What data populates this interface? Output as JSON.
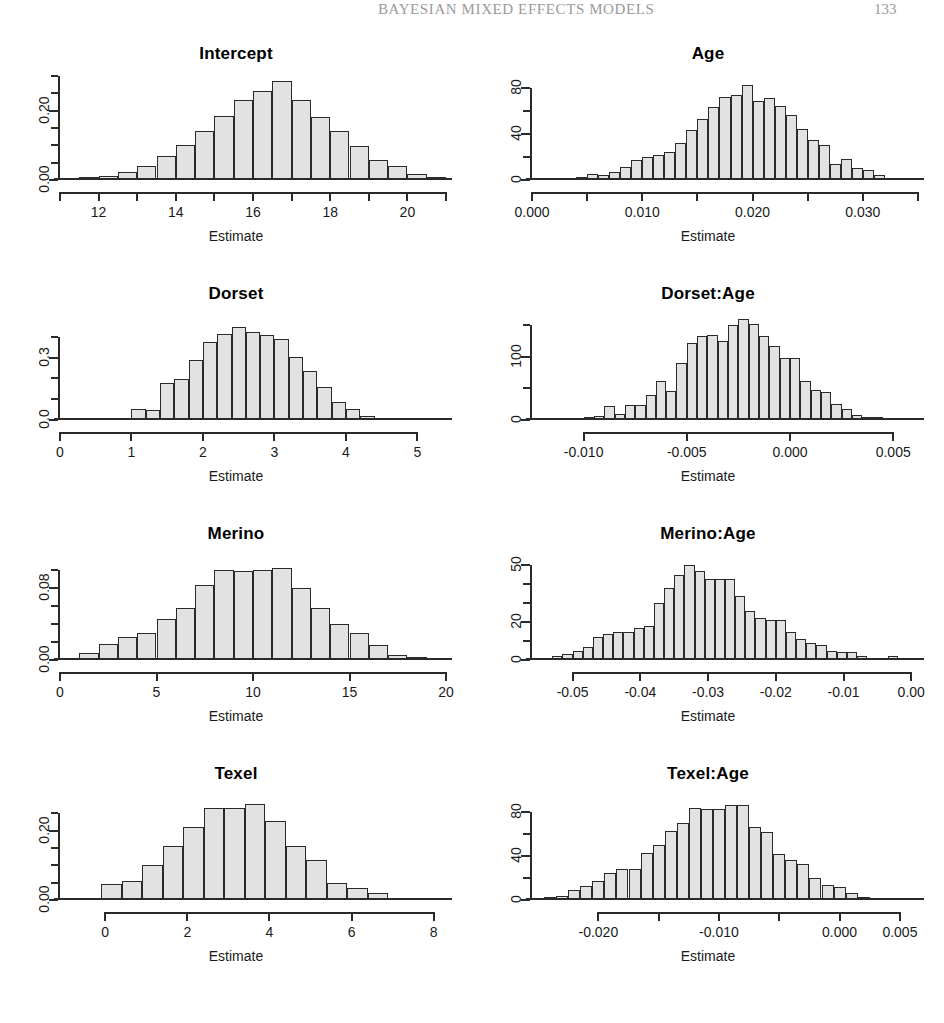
{
  "running_head": {
    "title": "BAYESIAN MIXED EFFECTS MODELS",
    "page_number": "133"
  },
  "figure": {
    "shared_xlabel": "Estimate",
    "panels": [
      {
        "title": "Intercept",
        "xlabel": "Estimate",
        "chart_data": {
          "type": "bar",
          "title": "Intercept",
          "xlabel": "Estimate",
          "ylabel": "Density",
          "xlim": [
            11.0,
            21.0
          ],
          "ylim": [
            0.0,
            0.3
          ],
          "bin_width": 0.5,
          "x_ticks": [
            12,
            14,
            16,
            18,
            20
          ],
          "x_tick_labels": [
            "12",
            "14",
            "16",
            "18",
            "20"
          ],
          "x_minor_ticks": [
            11,
            13,
            15,
            17,
            19,
            21
          ],
          "y_ticks": [
            0.0,
            0.05,
            0.1,
            0.15,
            0.2,
            0.25,
            0.3
          ],
          "y_tick_labels": [
            "0.00",
            "",
            "",
            "",
            "0.20",
            "",
            ""
          ],
          "y_labeled_ticks": [
            0.0,
            0.2
          ],
          "grid": false,
          "bin_starts": [
            11.0,
            11.5,
            12.0,
            12.5,
            13.0,
            13.5,
            14.0,
            14.5,
            15.0,
            15.5,
            16.0,
            16.5,
            17.0,
            17.5,
            18.0,
            18.5,
            19.0,
            19.5,
            20.0,
            20.5
          ],
          "values": [
            0.004,
            0.008,
            0.012,
            0.022,
            0.04,
            0.068,
            0.1,
            0.14,
            0.185,
            0.232,
            0.258,
            0.286,
            0.232,
            0.182,
            0.14,
            0.098,
            0.058,
            0.04,
            0.018,
            0.008
          ]
        }
      },
      {
        "title": "Age",
        "xlabel": "Estimate",
        "chart_data": {
          "type": "bar",
          "title": "Age",
          "xlabel": "Estimate",
          "ylabel": "Frequency",
          "xlim": [
            0.0,
            0.035
          ],
          "ylim": [
            0,
            90
          ],
          "bin_width": 0.001,
          "x_ticks": [
            0.0,
            0.01,
            0.02,
            0.03
          ],
          "x_tick_labels": [
            "0.000",
            "0.010",
            "0.020",
            "0.030"
          ],
          "x_minor_ticks": [
            0.005,
            0.015,
            0.025,
            0.035
          ],
          "y_ticks": [
            0,
            20,
            40,
            60,
            80
          ],
          "y_tick_labels": [
            "0",
            "",
            "40",
            "",
            "80"
          ],
          "y_labeled_ticks": [
            0,
            40,
            80
          ],
          "grid": false,
          "bin_starts": [
            0.0,
            0.001,
            0.002,
            0.003,
            0.004,
            0.005,
            0.006,
            0.007,
            0.008,
            0.009,
            0.01,
            0.011,
            0.012,
            0.013,
            0.014,
            0.015,
            0.016,
            0.017,
            0.018,
            0.019,
            0.02,
            0.021,
            0.022,
            0.023,
            0.024,
            0.025,
            0.026,
            0.027,
            0.028,
            0.029,
            0.03,
            0.031,
            0.032,
            0.033,
            0.034
          ],
          "values": [
            0,
            0,
            0,
            1,
            3,
            5,
            4,
            7,
            11,
            17,
            20,
            22,
            24,
            32,
            43,
            53,
            63,
            72,
            74,
            82,
            68,
            71,
            64,
            56,
            44,
            35,
            30,
            14,
            18,
            10,
            9,
            4,
            2,
            2,
            1
          ]
        }
      },
      {
        "title": "Dorset",
        "xlabel": "Estimate",
        "chart_data": {
          "type": "bar",
          "title": "Dorset",
          "xlabel": "Estimate",
          "ylabel": "Density",
          "xlim": [
            0.0,
            5.4
          ],
          "ylim": [
            0.0,
            0.5
          ],
          "bin_width": 0.2,
          "x_ticks": [
            0,
            1,
            2,
            3,
            4,
            5
          ],
          "x_tick_labels": [
            "0",
            "1",
            "2",
            "3",
            "4",
            "5"
          ],
          "x_minor_ticks": [],
          "y_ticks": [
            0.0,
            0.1,
            0.2,
            0.3,
            0.4
          ],
          "y_tick_labels": [
            "0.0",
            "",
            "",
            "0.3",
            ""
          ],
          "y_labeled_ticks": [
            0.0,
            0.3
          ],
          "grid": false,
          "bin_starts": [
            0.2,
            0.4,
            0.6,
            0.8,
            1.0,
            1.2,
            1.4,
            1.6,
            1.8,
            2.0,
            2.2,
            2.4,
            2.6,
            2.8,
            3.0,
            3.2,
            3.4,
            3.6,
            3.8,
            4.0,
            4.2,
            4.4,
            4.6,
            4.8,
            5.0
          ],
          "values": [
            0.005,
            0.007,
            0.008,
            0.01,
            0.055,
            0.05,
            0.18,
            0.195,
            0.29,
            0.375,
            0.415,
            0.445,
            0.425,
            0.41,
            0.39,
            0.305,
            0.235,
            0.16,
            0.085,
            0.055,
            0.018,
            0.008,
            0.005,
            0.004,
            0.004
          ]
        }
      },
      {
        "title": "Dorset:Age",
        "xlabel": "Estimate",
        "chart_data": {
          "type": "bar",
          "title": "Dorset:Age",
          "xlabel": "Estimate",
          "ylabel": "Frequency",
          "xlim": [
            -0.0125,
            0.0062
          ],
          "ylim": [
            0,
            165
          ],
          "bin_width": 0.0005,
          "x_ticks": [
            -0.01,
            -0.005,
            0.0,
            0.005
          ],
          "x_tick_labels": [
            "-0.010",
            "-0.005",
            "0.000",
            "0.005"
          ],
          "x_minor_ticks": [],
          "y_ticks": [
            0,
            50,
            100,
            150
          ],
          "y_tick_labels": [
            "0",
            "",
            "100",
            ""
          ],
          "y_labeled_ticks": [
            0,
            100
          ],
          "grid": false,
          "bin_starts": [
            -0.0125,
            -0.012,
            -0.0115,
            -0.011,
            -0.0105,
            -0.01,
            -0.0095,
            -0.009,
            -0.0085,
            -0.008,
            -0.0075,
            -0.007,
            -0.0065,
            -0.006,
            -0.0055,
            -0.005,
            -0.0045,
            -0.004,
            -0.0035,
            -0.003,
            -0.0025,
            -0.002,
            -0.0015,
            -0.001,
            -0.0005,
            0.0,
            0.0005,
            0.001,
            0.0015,
            0.002,
            0.0025,
            0.003,
            0.0035,
            0.004,
            0.0045,
            0.005,
            0.0055
          ],
          "values": [
            2,
            2,
            2,
            3,
            3,
            4,
            6,
            22,
            10,
            24,
            24,
            40,
            62,
            46,
            90,
            122,
            133,
            135,
            126,
            150,
            160,
            152,
            133,
            118,
            98,
            98,
            62,
            48,
            44,
            26,
            18,
            8,
            5,
            4,
            3,
            2,
            2
          ]
        }
      },
      {
        "title": "Merino",
        "xlabel": "Estimate",
        "chart_data": {
          "type": "bar",
          "title": "Merino",
          "xlabel": "Estimate",
          "ylabel": "Density",
          "xlim": [
            0.0,
            20.0
          ],
          "ylim": [
            0.0,
            0.115
          ],
          "bin_width": 1.0,
          "x_ticks": [
            0,
            5,
            10,
            15,
            20
          ],
          "x_tick_labels": [
            "0",
            "5",
            "10",
            "15",
            "20"
          ],
          "x_minor_ticks": [],
          "y_ticks": [
            0.0,
            0.02,
            0.04,
            0.06,
            0.08,
            0.1
          ],
          "y_tick_labels": [
            "0.00",
            "",
            "",
            "",
            "0.08",
            ""
          ],
          "y_labeled_ticks": [
            0.0,
            0.08
          ],
          "grid": false,
          "bin_starts": [
            1,
            2,
            3,
            4,
            5,
            6,
            7,
            8,
            9,
            10,
            11,
            12,
            13,
            14,
            15,
            16,
            17,
            18
          ],
          "values": [
            0.008,
            0.018,
            0.025,
            0.03,
            0.045,
            0.058,
            0.083,
            0.1,
            0.098,
            0.1,
            0.102,
            0.08,
            0.057,
            0.04,
            0.03,
            0.017,
            0.006,
            0.003
          ]
        }
      },
      {
        "title": "Merino:Age",
        "xlabel": "Estimate",
        "chart_data": {
          "type": "bar",
          "title": "Merino:Age",
          "xlabel": "Estimate",
          "ylabel": "Frequency",
          "xlim": [
            -0.056,
            0.001
          ],
          "ylim": [
            0,
            55
          ],
          "bin_width": 0.0015,
          "x_ticks": [
            -0.05,
            -0.04,
            -0.03,
            -0.02,
            -0.01,
            0.0
          ],
          "x_tick_labels": [
            "-0.05",
            "-0.04",
            "-0.03",
            "-0.02",
            "-0.01",
            "0.00"
          ],
          "x_minor_ticks": [],
          "y_ticks": [
            0,
            10,
            20,
            30,
            40,
            50
          ],
          "y_tick_labels": [
            "0",
            "",
            "20",
            "",
            "",
            "50"
          ],
          "y_labeled_ticks": [
            0,
            20,
            50
          ],
          "grid": false,
          "bin_starts": [
            -0.056,
            -0.0545,
            -0.053,
            -0.0515,
            -0.05,
            -0.0485,
            -0.047,
            -0.0455,
            -0.044,
            -0.0425,
            -0.041,
            -0.0395,
            -0.038,
            -0.0365,
            -0.035,
            -0.0335,
            -0.032,
            -0.0305,
            -0.029,
            -0.0275,
            -0.026,
            -0.0245,
            -0.023,
            -0.0215,
            -0.02,
            -0.0185,
            -0.017,
            -0.0155,
            -0.014,
            -0.0125,
            -0.011,
            -0.0095,
            -0.008,
            -0.0065,
            -0.005,
            -0.0035,
            -0.002,
            -0.0005
          ],
          "values": [
            1,
            1,
            2,
            3,
            5,
            7,
            12,
            14,
            15,
            15,
            17,
            18,
            30,
            38,
            45,
            50,
            47,
            43,
            43,
            43,
            34,
            26,
            22,
            21,
            21,
            15,
            11,
            9,
            8,
            5,
            4,
            4,
            2,
            1,
            1,
            2,
            1,
            1
          ]
        }
      },
      {
        "title": "Texel",
        "xlabel": "Estimate",
        "chart_data": {
          "type": "bar",
          "title": "Texel",
          "xlabel": "Estimate",
          "ylabel": "Density",
          "xlim": [
            -1.1,
            8.3
          ],
          "ylim": [
            0.0,
            0.3
          ],
          "bin_width": 0.5,
          "x_ticks": [
            0,
            2,
            4,
            6,
            8
          ],
          "x_tick_labels": [
            "0",
            "2",
            "4",
            "6",
            "8"
          ],
          "x_minor_ticks": [],
          "y_ticks": [
            0.0,
            0.05,
            0.1,
            0.15,
            0.2,
            0.25
          ],
          "y_tick_labels": [
            "0.00",
            "",
            "",
            "",
            "0.20",
            ""
          ],
          "y_labeled_ticks": [
            0.0,
            0.2
          ],
          "grid": false,
          "bin_starts": [
            -1.1,
            -0.6,
            -0.1,
            0.4,
            0.9,
            1.4,
            1.9,
            2.4,
            2.9,
            3.4,
            3.9,
            4.4,
            4.9,
            5.4,
            5.9,
            6.4,
            6.9,
            7.4,
            7.9
          ],
          "values": [
            0.004,
            0.006,
            0.045,
            0.055,
            0.1,
            0.155,
            0.21,
            0.265,
            0.265,
            0.278,
            0.228,
            0.155,
            0.115,
            0.048,
            0.035,
            0.02,
            0.006,
            0.004,
            0.003
          ]
        }
      },
      {
        "title": "Texel:Age",
        "xlabel": "Estimate",
        "chart_data": {
          "type": "bar",
          "title": "Texel:Age",
          "xlabel": "Estimate",
          "ylabel": "Frequency",
          "xlim": [
            -0.0255,
            0.0065
          ],
          "ylim": [
            0,
            95
          ],
          "bin_width": 0.001,
          "x_ticks": [
            -0.02,
            -0.015,
            -0.01,
            -0.005,
            0.0,
            0.005
          ],
          "x_tick_labels": [
            "-0.020",
            "",
            "-0.010",
            "",
            "0.000",
            "0.005"
          ],
          "x_minor_ticks": [],
          "y_ticks": [
            0,
            20,
            40,
            60,
            80
          ],
          "y_tick_labels": [
            "0",
            "",
            "40",
            "",
            "80"
          ],
          "y_labeled_ticks": [
            0,
            40,
            80
          ],
          "grid": false,
          "bin_starts": [
            -0.0255,
            -0.0245,
            -0.0235,
            -0.0225,
            -0.0215,
            -0.0205,
            -0.0195,
            -0.0185,
            -0.0175,
            -0.0165,
            -0.0155,
            -0.0145,
            -0.0135,
            -0.0125,
            -0.0115,
            -0.0105,
            -0.0095,
            -0.0085,
            -0.0075,
            -0.0065,
            -0.0055,
            -0.0045,
            -0.0035,
            -0.0025,
            -0.0015,
            -0.0005,
            0.0005,
            0.0015,
            0.0025,
            0.0035,
            0.0045,
            0.0055
          ],
          "values": [
            2,
            3,
            4,
            9,
            13,
            17,
            25,
            28,
            28,
            43,
            50,
            63,
            70,
            84,
            83,
            83,
            87,
            87,
            67,
            62,
            42,
            37,
            33,
            20,
            14,
            12,
            6,
            3,
            2,
            1,
            1,
            1
          ]
        }
      }
    ]
  }
}
